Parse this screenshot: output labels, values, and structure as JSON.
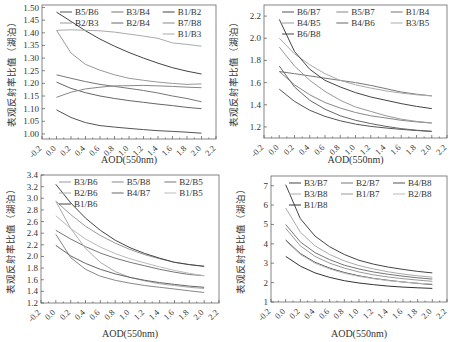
{
  "figure": {
    "ylabel": "表观反射率比值（湖泊）",
    "xlabel": "AOD(550nm)"
  },
  "chart_data": [
    {
      "type": "line",
      "panel": "top-left",
      "xlabel": "AOD(550nm)",
      "ylabel": "表观反射率比值（湖泊）",
      "xlim": [
        -0.2,
        2.2
      ],
      "xticks": [
        "-0.2",
        "0.0",
        "0.2",
        "0.4",
        "0.6",
        "0.8",
        "1.0",
        "1.2",
        "1.4",
        "1.6",
        "1.8",
        "2.0",
        "2.2"
      ],
      "ylim": [
        0.98,
        1.51
      ],
      "yticks": [
        "1.00",
        "1.05",
        "1.10",
        "1.15",
        "1.20",
        "1.25",
        "1.30",
        "1.35",
        "1.40",
        "1.45",
        "1.50"
      ],
      "grid": false,
      "legend_position": "upper right",
      "legend_cols": 3,
      "x": [
        0.0,
        0.2,
        0.4,
        0.6,
        0.8,
        1.0,
        1.2,
        1.4,
        1.6,
        1.8,
        2.0
      ],
      "series": [
        {
          "name": "B5/B6",
          "color": "#555555",
          "values": [
            1.095,
            1.065,
            1.045,
            1.033,
            1.027,
            1.022,
            1.017,
            1.013,
            1.01,
            1.007,
            1.003
          ]
        },
        {
          "name": "B3/B4",
          "color": "#777777",
          "values": [
            1.234,
            1.22,
            1.207,
            1.196,
            1.188,
            1.18,
            1.172,
            1.162,
            1.15,
            1.14,
            1.127
          ]
        },
        {
          "name": "B1/B2",
          "color": "#444444",
          "values": [
            1.482,
            1.445,
            1.408,
            1.375,
            1.347,
            1.322,
            1.3,
            1.28,
            1.262,
            1.248,
            1.237
          ]
        },
        {
          "name": "B2/B3",
          "color": "#999999",
          "values": [
            1.41,
            1.32,
            1.275,
            1.252,
            1.234,
            1.22,
            1.212,
            1.205,
            1.2,
            1.196,
            1.198
          ]
        },
        {
          "name": "B2/B4",
          "color": "#666666",
          "values": [
            1.205,
            1.18,
            1.163,
            1.15,
            1.14,
            1.132,
            1.125,
            1.118,
            1.112,
            1.105,
            1.1
          ]
        },
        {
          "name": "B7/B8",
          "color": "#888888",
          "values": [
            1.145,
            1.165,
            1.178,
            1.185,
            1.19,
            1.191,
            1.192,
            1.19,
            1.188,
            1.185,
            1.183
          ]
        },
        {
          "name": "B1/B3",
          "color": "#aaaaaa",
          "values": [
            1.41,
            1.412,
            1.41,
            1.408,
            1.403,
            1.395,
            1.387,
            1.378,
            1.36,
            1.354,
            1.347
          ]
        }
      ]
    },
    {
      "type": "line",
      "panel": "top-right",
      "xlabel": "AOD(550nm)",
      "ylabel": "表观反射率比值（湖泊）",
      "xlim": [
        -0.2,
        2.2
      ],
      "xticks": [
        "-0.2",
        "0.0",
        "0.2",
        "0.4",
        "0.6",
        "0.8",
        "1.0",
        "1.2",
        "1.4",
        "1.6",
        "1.8",
        "2.0",
        "2.2"
      ],
      "ylim": [
        1.1,
        2.3
      ],
      "yticks": [
        "1.2",
        "1.4",
        "1.6",
        "1.8",
        "2.0",
        "2.2"
      ],
      "grid": false,
      "legend_position": "upper right",
      "legend_cols": 3,
      "x": [
        0.0,
        0.2,
        0.4,
        0.6,
        0.8,
        1.0,
        1.2,
        1.4,
        1.6,
        1.8,
        2.0
      ],
      "series": [
        {
          "name": "B6/B7",
          "color": "#555555",
          "values": [
            1.54,
            1.43,
            1.35,
            1.295,
            1.255,
            1.225,
            1.205,
            1.19,
            1.178,
            1.168,
            1.16
          ]
        },
        {
          "name": "B5/B7",
          "color": "#888888",
          "values": [
            1.7,
            1.58,
            1.49,
            1.42,
            1.37,
            1.33,
            1.3,
            1.28,
            1.26,
            1.245,
            1.235
          ]
        },
        {
          "name": "B1/B4",
          "color": "#777777",
          "values": [
            1.7,
            1.68,
            1.66,
            1.64,
            1.62,
            1.6,
            1.575,
            1.545,
            1.515,
            1.495,
            1.48
          ]
        },
        {
          "name": "B4/B5",
          "color": "#999999",
          "values": [
            1.92,
            1.75,
            1.62,
            1.52,
            1.44,
            1.38,
            1.34,
            1.3,
            1.27,
            1.25,
            1.235
          ]
        },
        {
          "name": "B4/B6",
          "color": "#666666",
          "values": [
            1.75,
            1.56,
            1.44,
            1.36,
            1.3,
            1.26,
            1.23,
            1.205,
            1.185,
            1.17,
            1.16
          ]
        },
        {
          "name": "B3/B5",
          "color": "#aaaaaa",
          "values": [
            2.0,
            1.86,
            1.76,
            1.68,
            1.62,
            1.58,
            1.55,
            1.525,
            1.505,
            1.49,
            1.48
          ]
        },
        {
          "name": "B6/B8",
          "color": "#444444",
          "values": [
            2.17,
            1.88,
            1.72,
            1.62,
            1.56,
            1.51,
            1.47,
            1.44,
            1.41,
            1.385,
            1.365
          ]
        }
      ]
    },
    {
      "type": "line",
      "panel": "bottom-left",
      "xlabel": "AOD(550nm)",
      "ylabel": "表观反射率比值（湖泊）",
      "xlim": [
        -0.2,
        2.2
      ],
      "xticks": [
        "-0.2",
        "0.0",
        "0.2",
        "0.4",
        "0.6",
        "0.8",
        "1.0",
        "1.2",
        "1.4",
        "1.6",
        "1.8",
        "2.0",
        "2.2"
      ],
      "ylim": [
        1.2,
        3.4
      ],
      "yticks": [
        "1.2",
        "1.4",
        "1.6",
        "1.8",
        "2.0",
        "2.2",
        "2.4",
        "2.6",
        "2.8",
        "3.0",
        "3.2",
        "3.4"
      ],
      "grid": false,
      "legend_position": "upper right",
      "legend_cols": 3,
      "x": [
        0.0,
        0.2,
        0.4,
        0.6,
        0.8,
        1.0,
        1.2,
        1.4,
        1.6,
        1.8,
        2.0
      ],
      "series": [
        {
          "name": "B3/B6",
          "color": "#999999",
          "values": [
            2.95,
            2.72,
            2.52,
            2.36,
            2.23,
            2.12,
            2.03,
            1.96,
            1.9,
            1.86,
            1.83
          ]
        },
        {
          "name": "B5/B8",
          "color": "#888888",
          "values": [
            2.38,
            1.98,
            1.78,
            1.66,
            1.59,
            1.54,
            1.5,
            1.47,
            1.44,
            1.41,
            1.38
          ]
        },
        {
          "name": "B2/B5",
          "color": "#777777",
          "values": [
            2.45,
            2.3,
            2.17,
            2.06,
            1.97,
            1.9,
            1.84,
            1.78,
            1.73,
            1.69,
            1.67
          ]
        },
        {
          "name": "B2/B6",
          "color": "#aaaaaa",
          "values": [
            2.95,
            2.48,
            2.14,
            1.9,
            1.74,
            1.64,
            1.58,
            1.53,
            1.5,
            1.47,
            1.45
          ]
        },
        {
          "name": "B4/B7",
          "color": "#666666",
          "values": [
            2.19,
            2.01,
            1.88,
            1.78,
            1.7,
            1.64,
            1.59,
            1.55,
            1.52,
            1.49,
            1.47
          ]
        },
        {
          "name": "B1/B5",
          "color": "#bbbbbb",
          "values": [
            2.7,
            2.48,
            2.3,
            2.16,
            2.05,
            1.96,
            1.89,
            1.82,
            1.76,
            1.71,
            1.67
          ]
        },
        {
          "name": "B1/B6",
          "color": "#444444",
          "values": [
            3.24,
            2.92,
            2.66,
            2.45,
            2.28,
            2.15,
            2.05,
            1.97,
            1.9,
            1.86,
            1.83
          ]
        }
      ]
    },
    {
      "type": "line",
      "panel": "bottom-right",
      "xlabel": "AOD(550nm)",
      "ylabel": "表观反射率比值（湖泊）",
      "xlim": [
        -0.2,
        2.2
      ],
      "xticks": [
        "-0.2",
        "0.0",
        "0.2",
        "0.4",
        "0.6",
        "0.8",
        "1.0",
        "1.2",
        "1.4",
        "1.6",
        "1.8",
        "2.0",
        "2.2"
      ],
      "ylim": [
        1,
        7.5
      ],
      "yticks": [
        "1",
        "2",
        "3",
        "4",
        "5",
        "6",
        "7"
      ],
      "grid": false,
      "legend_position": "upper right",
      "legend_cols": 3,
      "x": [
        0.0,
        0.2,
        0.4,
        0.6,
        0.8,
        1.0,
        1.2,
        1.4,
        1.6,
        1.8,
        2.0
      ],
      "series": [
        {
          "name": "B3/B7",
          "color": "#444444",
          "values": [
            7.05,
            5.3,
            4.4,
            3.85,
            3.45,
            3.15,
            2.95,
            2.8,
            2.68,
            2.58,
            2.5
          ]
        },
        {
          "name": "B2/B7",
          "color": "#777777",
          "values": [
            5.0,
            4.1,
            3.55,
            3.18,
            2.9,
            2.7,
            2.55,
            2.43,
            2.33,
            2.25,
            2.18
          ]
        },
        {
          "name": "B4/B8",
          "color": "#555555",
          "values": [
            4.2,
            3.5,
            3.05,
            2.75,
            2.52,
            2.35,
            2.22,
            2.12,
            2.03,
            1.96,
            1.9
          ]
        },
        {
          "name": "B3/B8",
          "color": "#aaaaaa",
          "values": [
            5.85,
            4.6,
            3.9,
            3.45,
            3.12,
            2.88,
            2.7,
            2.56,
            2.44,
            2.35,
            2.28
          ]
        },
        {
          "name": "B1/B7",
          "color": "#999999",
          "values": [
            4.8,
            3.9,
            3.35,
            3.0,
            2.75,
            2.55,
            2.4,
            2.29,
            2.2,
            2.13,
            2.07
          ]
        },
        {
          "name": "B2/B8",
          "color": "#bbbbbb",
          "values": [
            4.15,
            3.45,
            3.0,
            2.7,
            2.48,
            2.32,
            2.2,
            2.1,
            2.03,
            1.97,
            1.93
          ]
        },
        {
          "name": "B1/B8",
          "color": "#333333",
          "values": [
            3.35,
            2.85,
            2.5,
            2.27,
            2.1,
            1.98,
            1.89,
            1.82,
            1.77,
            1.73,
            1.7
          ]
        }
      ]
    }
  ],
  "layout": {
    "panels": [
      {
        "left": 42,
        "top": 5,
        "width": 174,
        "height": 134
      },
      {
        "left": 264,
        "top": 5,
        "width": 183,
        "height": 133
      },
      {
        "left": 41,
        "top": 175,
        "width": 178,
        "height": 128
      },
      {
        "left": 271,
        "top": 176,
        "width": 176,
        "height": 126
      }
    ]
  }
}
